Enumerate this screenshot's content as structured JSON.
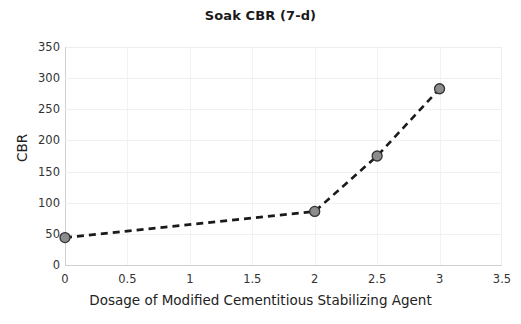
{
  "chart_data": {
    "type": "line",
    "title": "Soak CBR (7-d)",
    "xlabel": "Dosage of Modified Cementitious Stabilizing Agent",
    "ylabel": "CBR",
    "x": [
      0,
      2,
      2.5,
      3
    ],
    "values": [
      44,
      86,
      175,
      283
    ],
    "series": [
      {
        "name": "Soak CBR (7-d)",
        "x": [
          0,
          2,
          2.5,
          3
        ],
        "values": [
          44,
          86,
          175,
          283
        ]
      }
    ],
    "xlim": [
      0,
      3.5
    ],
    "ylim": [
      0,
      350
    ],
    "xticks": [
      "0",
      "0.5",
      "1",
      "1.5",
      "2",
      "2.5",
      "3",
      "3.5"
    ],
    "xtick_values": [
      0,
      0.5,
      1,
      1.5,
      2,
      2.5,
      3,
      3.5
    ],
    "yticks": [
      "0",
      "50",
      "100",
      "150",
      "200",
      "250",
      "300",
      "350"
    ],
    "ytick_values": [
      0,
      50,
      100,
      150,
      200,
      250,
      300,
      350
    ],
    "grid": true,
    "legend": false,
    "line_style": "dashed",
    "line_color": "#1a1a1a",
    "marker": "circle",
    "marker_face_color": "#8c8c8c",
    "marker_edge_color": "#333333",
    "background_color": "#ffffff",
    "grid_color": "#f0f0f0"
  }
}
